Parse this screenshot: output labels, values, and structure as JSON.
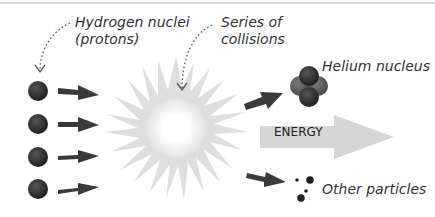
{
  "labels": {
    "hydrogen_line1": "Hydrogen nuclei",
    "hydrogen_line2": "(protons)",
    "collisions_line1": "Series of",
    "collisions_line2": "collisions",
    "helium": "Helium nucleus",
    "energy": "ENERGY",
    "other": "Other particles"
  },
  "colors": {
    "proton": "#2e2e2e",
    "neutron": "#5a5a5a",
    "arrow": "#3a3a3a",
    "burst": "#dedede",
    "energy_arrow": "#d6d6d6"
  },
  "protons_count": 4
}
